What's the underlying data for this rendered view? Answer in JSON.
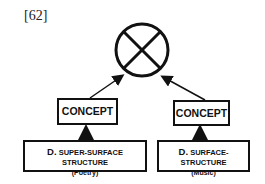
{
  "figure": {
    "number": "[62]",
    "top_symbol": "circle-with-x",
    "concept_left": "CONCEPT",
    "concept_right": "CONCEPT",
    "left_structure": {
      "prefix": "D.",
      "title": "SUPER-SURFACE STRUCTURE",
      "subtitle": "(Poetry)"
    },
    "right_structure": {
      "prefix": "D.",
      "title": "SURFACE-STRUCTURE",
      "subtitle": "(Music)"
    }
  }
}
